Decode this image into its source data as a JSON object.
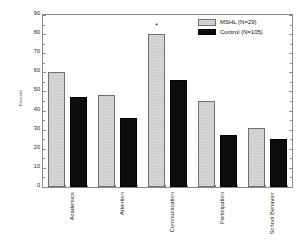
{
  "chart_data": {
    "type": "bar",
    "title": "",
    "subtitle": "",
    "xlabel": "",
    "ylabel": "Percent",
    "ylim": [
      0,
      90
    ],
    "ytick_step": 10,
    "yticks": [
      0,
      10,
      20,
      30,
      40,
      50,
      60,
      70,
      80,
      90
    ],
    "ytick_labels": [
      "0",
      "10",
      "20",
      "30",
      "40",
      "50",
      "60",
      "70",
      "80",
      "90"
    ],
    "grid": false,
    "legend_position": "top-right",
    "categories": [
      "Academics",
      "Attention",
      "Communication",
      "Participation",
      "School Behavior"
    ],
    "series": [
      {
        "name": "MSHL (N=29)",
        "color": "#c6c6c6",
        "edge_color": "#707070",
        "values": [
          60,
          48,
          80,
          45,
          31
        ]
      },
      {
        "name": "Control (N=105)",
        "color": "#0d0d0d",
        "edge_color": "#000000",
        "values": [
          47,
          36,
          56,
          27,
          25
        ]
      }
    ],
    "annotations": [
      {
        "text": "*",
        "category": "Communication",
        "series": "MSHL (N=29)",
        "value": 80
      }
    ]
  },
  "legend": {
    "entries": [
      {
        "label": "MSHL (N=29)"
      },
      {
        "label": "Control (N=105)"
      }
    ]
  },
  "axes": {
    "y_axis_title": "Percent"
  }
}
